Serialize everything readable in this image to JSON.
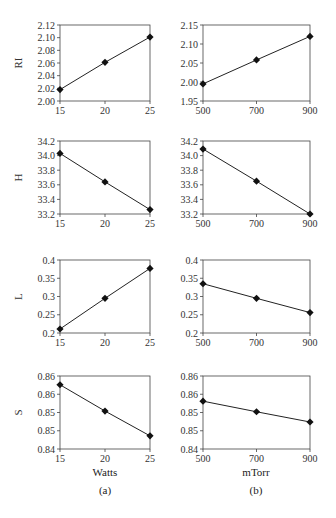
{
  "figure": {
    "column_a": {
      "xlabel": "Watts",
      "panel_label": "(a)"
    },
    "column_b": {
      "xlabel": "mTorr",
      "panel_label": "(b)"
    }
  },
  "chart_data": [
    {
      "type": "line",
      "panel": "a",
      "ylabel": "RI",
      "xlabel": "",
      "x": [
        15,
        20,
        25
      ],
      "xticks": [
        "15",
        "20",
        "25"
      ],
      "values": [
        2.018,
        2.061,
        2.101
      ],
      "ylim": [
        2.0,
        2.12
      ],
      "yticks": [
        "2.00",
        "2.02",
        "2.04",
        "2.06",
        "2.08",
        "2.10",
        "2.12"
      ],
      "ytick_vals": [
        2.0,
        2.02,
        2.04,
        2.06,
        2.08,
        2.1,
        2.12
      ],
      "grid": false,
      "marker": "diamond"
    },
    {
      "type": "line",
      "panel": "b",
      "ylabel": "",
      "xlabel": "",
      "x": [
        500,
        700,
        900
      ],
      "xticks": [
        "500",
        "700",
        "900"
      ],
      "values": [
        1.995,
        2.058,
        2.12
      ],
      "ylim": [
        1.95,
        2.15
      ],
      "yticks": [
        "1.95",
        "2.00",
        "2.05",
        "2.10",
        "2.15"
      ],
      "ytick_vals": [
        1.95,
        2.0,
        2.05,
        2.1,
        2.15
      ],
      "grid": false,
      "marker": "diamond"
    },
    {
      "type": "line",
      "panel": "a",
      "ylabel": "H",
      "xlabel": "",
      "x": [
        15,
        20,
        25
      ],
      "xticks": [
        "15",
        "20",
        "25"
      ],
      "values": [
        34.03,
        33.64,
        33.26
      ],
      "ylim": [
        33.2,
        34.2
      ],
      "yticks": [
        "33.2",
        "33.4",
        "33.6",
        "33.8",
        "34.0",
        "34.2"
      ],
      "ytick_vals": [
        33.2,
        33.4,
        33.6,
        33.8,
        34.0,
        34.2
      ],
      "grid": false,
      "marker": "diamond"
    },
    {
      "type": "line",
      "panel": "b",
      "ylabel": "",
      "xlabel": "",
      "x": [
        500,
        700,
        900
      ],
      "xticks": [
        "500",
        "700",
        "900"
      ],
      "values": [
        34.09,
        33.65,
        33.2
      ],
      "ylim": [
        33.2,
        34.2
      ],
      "yticks": [
        "33.2",
        "33.4",
        "33.6",
        "33.8",
        "34.0",
        "34.2"
      ],
      "ytick_vals": [
        33.2,
        33.4,
        33.6,
        33.8,
        34.0,
        34.2
      ],
      "grid": false,
      "marker": "diamond"
    },
    {
      "type": "line",
      "panel": "a",
      "ylabel": "L",
      "xlabel": "",
      "x": [
        15,
        20,
        25
      ],
      "xticks": [
        "15",
        "20",
        "25"
      ],
      "values": [
        0.211,
        0.295,
        0.377
      ],
      "ylim": [
        0.2,
        0.4
      ],
      "yticks": [
        "0.2",
        "0.25",
        "0.3",
        "0.35",
        "0.4"
      ],
      "ytick_vals": [
        0.2,
        0.25,
        0.3,
        0.35,
        0.4
      ],
      "grid": false,
      "marker": "diamond"
    },
    {
      "type": "line",
      "panel": "b",
      "ylabel": "",
      "xlabel": "",
      "x": [
        500,
        700,
        900
      ],
      "xticks": [
        "500",
        "700",
        "900"
      ],
      "values": [
        0.335,
        0.295,
        0.256
      ],
      "ylim": [
        0.2,
        0.4
      ],
      "yticks": [
        "0.2",
        "0.25",
        "0.3",
        "0.35",
        "0.4"
      ],
      "ytick_vals": [
        0.2,
        0.25,
        0.3,
        0.35,
        0.4
      ],
      "grid": false,
      "marker": "diamond"
    },
    {
      "type": "line",
      "panel": "a",
      "ylabel": "S",
      "xlabel": "Watts",
      "x": [
        15,
        20,
        25
      ],
      "xticks": [
        "15",
        "20",
        "25"
      ],
      "values": [
        0.8576,
        0.8504,
        0.8436
      ],
      "ylim": [
        0.84,
        0.86
      ],
      "yticks": [
        "0.84",
        "0.85",
        "0.85",
        "0.86",
        "0.86"
      ],
      "ytick_vals": [
        0.84,
        0.845,
        0.85,
        0.855,
        0.86
      ],
      "grid": false,
      "marker": "diamond"
    },
    {
      "type": "line",
      "panel": "b",
      "ylabel": "",
      "xlabel": "mTorr",
      "x": [
        500,
        700,
        900
      ],
      "xticks": [
        "500",
        "700",
        "900"
      ],
      "values": [
        0.8531,
        0.8502,
        0.8474
      ],
      "ylim": [
        0.84,
        0.86
      ],
      "yticks": [
        "0.84",
        "0.85",
        "0.85",
        "0.86",
        "0.86"
      ],
      "ytick_vals": [
        0.84,
        0.845,
        0.85,
        0.855,
        0.86
      ],
      "grid": false,
      "marker": "diamond"
    }
  ]
}
